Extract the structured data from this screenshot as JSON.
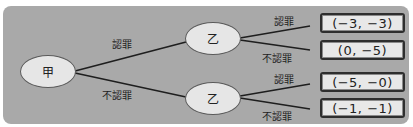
{
  "diagram": {
    "type": "game-tree",
    "colors": {
      "panel": "#a9a9a9",
      "node_fill": "#e6e6e6",
      "box_fill": "#e8e8e8",
      "line": "#1e1e1e"
    },
    "root": {
      "label": "甲"
    },
    "root_branches": [
      {
        "label": "認罪"
      },
      {
        "label": "不認罪"
      }
    ],
    "child_nodes": [
      {
        "label": "乙"
      },
      {
        "label": "乙"
      }
    ],
    "leaf_branches": [
      {
        "label": "認罪"
      },
      {
        "label": "不認罪"
      },
      {
        "label": "認罪"
      },
      {
        "label": "不認罪"
      }
    ],
    "payoffs": [
      {
        "text": "(−3, −3)"
      },
      {
        "text": "(0, −5)"
      },
      {
        "text": "(−5, −0)"
      },
      {
        "text": "(−1, −1)"
      }
    ]
  }
}
